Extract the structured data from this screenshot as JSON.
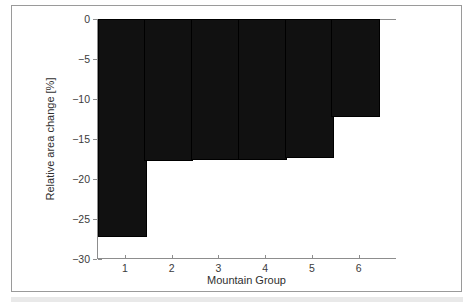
{
  "chart_data": {
    "type": "bar",
    "title": "",
    "xlabel": "Mountain Group",
    "ylabel": "Relative area change [%]",
    "categories": [
      "1",
      "2",
      "3",
      "4",
      "5",
      "6"
    ],
    "values": [
      -27.3,
      -17.8,
      -17.6,
      -17.6,
      -17.4,
      -12.3
    ],
    "ylim": [
      -30,
      0
    ],
    "yticks": [
      0,
      -5,
      -10,
      -15,
      -20,
      -25,
      -30
    ],
    "ytick_labels": [
      "0",
      "−5",
      "−10",
      "−15",
      "−20",
      "−25",
      "−30"
    ],
    "xticks": [
      1,
      2,
      3,
      4,
      5,
      6
    ],
    "xtick_labels": [
      "1",
      "2",
      "3",
      "4",
      "5",
      "6"
    ],
    "xlim": [
      0.4,
      6.8
    ],
    "grid": false,
    "legend": null,
    "bar_color": "#111111",
    "axis_color": "#8d8d8d",
    "background": "#ffffff"
  }
}
